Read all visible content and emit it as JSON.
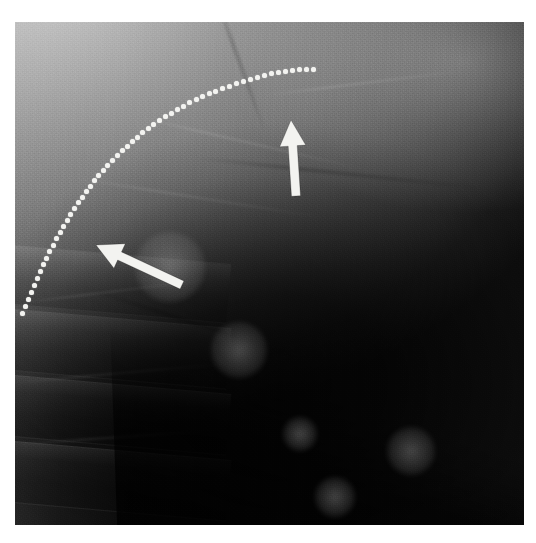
{
  "figure": {
    "kind": "radiograph",
    "modality": "X-ray",
    "view": "lateral chest / thoracolumbar spine",
    "alt": "Grayscale lateral radiograph of the chest showing a curved dotted line tracing a contour and two white arrows marking findings",
    "background_color": "#ffffff",
    "plate": {
      "x": 15,
      "y": 22,
      "width": 509,
      "height": 503,
      "tone_light": "#cfcfcf",
      "tone_mid": "#747474",
      "tone_dark": "#0d0d0d"
    }
  },
  "annotations": {
    "marker_color": "#f3f3f0",
    "dotted_curve": {
      "name": "contour-dotted-curve",
      "description": "dotted arc outlining an elevated contour",
      "dot_diameter": 5,
      "dot_count": 58,
      "points": [
        [
          22,
          313
        ],
        [
          25,
          306
        ],
        [
          28,
          299
        ],
        [
          31,
          292
        ],
        [
          34,
          285
        ],
        [
          37,
          278
        ],
        [
          40,
          271
        ],
        [
          43,
          264
        ],
        [
          46,
          258
        ],
        [
          49,
          251
        ],
        [
          53,
          245
        ],
        [
          56,
          238
        ],
        [
          60,
          232
        ],
        [
          63,
          226
        ],
        [
          67,
          220
        ],
        [
          70,
          214
        ],
        [
          74,
          208
        ],
        [
          78,
          202
        ],
        [
          82,
          197
        ],
        [
          86,
          191
        ],
        [
          90,
          186
        ],
        [
          94,
          180
        ],
        [
          98,
          175
        ],
        [
          103,
          170
        ],
        [
          107,
          165
        ],
        [
          112,
          160
        ],
        [
          117,
          155
        ],
        [
          122,
          150
        ],
        [
          127,
          146
        ],
        [
          132,
          141
        ],
        [
          137,
          137
        ],
        [
          142,
          132
        ],
        [
          148,
          128
        ],
        [
          153,
          124
        ],
        [
          159,
          120
        ],
        [
          165,
          116
        ],
        [
          171,
          113
        ],
        [
          177,
          109
        ],
        [
          183,
          106
        ],
        [
          189,
          102
        ],
        [
          196,
          99
        ],
        [
          202,
          96
        ],
        [
          209,
          93
        ],
        [
          215,
          91
        ],
        [
          222,
          88
        ],
        [
          229,
          86
        ],
        [
          236,
          83
        ],
        [
          243,
          81
        ],
        [
          250,
          79
        ],
        [
          257,
          77
        ],
        [
          264,
          75
        ],
        [
          271,
          73
        ],
        [
          278,
          72
        ],
        [
          285,
          71
        ],
        [
          292,
          70
        ],
        [
          299,
          69
        ],
        [
          306,
          69
        ],
        [
          313,
          69
        ]
      ]
    },
    "arrows": [
      {
        "name": "arrow-lower-left",
        "description": "white arrow pointing up and to the left toward the contour",
        "tip_x": 96,
        "tip_y": 245,
        "tail_x": 182,
        "tail_y": 285,
        "angle_deg": 205,
        "length": 95,
        "shaft_width": 9,
        "head_width": 27,
        "head_length": 26
      },
      {
        "name": "arrow-upper-vertical",
        "description": "white arrow pointing upward toward the opacity",
        "tip_x": 291,
        "tip_y": 120,
        "tail_x": 296,
        "tail_y": 196,
        "angle_deg": 274,
        "length": 76,
        "shaft_width": 9,
        "head_width": 26,
        "head_length": 26
      }
    ]
  },
  "anatomy_hints": {
    "vertebral_bodies": [
      {
        "top": 232,
        "height": 58
      },
      {
        "top": 296,
        "height": 60
      },
      {
        "top": 362,
        "height": 60
      },
      {
        "top": 428,
        "height": 60
      }
    ],
    "streaks": [
      {
        "left": 2,
        "top": 268,
        "width": 200,
        "rotate": -7
      },
      {
        "left": 0,
        "top": 350,
        "width": 215,
        "rotate": -5
      },
      {
        "left": 4,
        "top": 414,
        "width": 205,
        "rotate": -4
      },
      {
        "left": 120,
        "top": 120,
        "width": 230,
        "rotate": 13
      },
      {
        "left": 60,
        "top": 175,
        "width": 250,
        "rotate": 9
      },
      {
        "left": 250,
        "top": 60,
        "width": 200,
        "rotate": -7
      }
    ],
    "shadow_streaks": [
      {
        "left": 150,
        "top": 40,
        "width": 150,
        "rotate": 70
      },
      {
        "left": 178,
        "top": 150,
        "width": 300,
        "rotate": 6
      },
      {
        "left": 60,
        "top": 300,
        "width": 240,
        "rotate": 18
      }
    ],
    "blobs": [
      {
        "left": 268,
        "top": 395,
        "size": 34
      },
      {
        "left": 300,
        "top": 455,
        "size": 40
      },
      {
        "left": 372,
        "top": 405,
        "size": 48
      },
      {
        "left": 196,
        "top": 300,
        "size": 56
      },
      {
        "left": 120,
        "top": 210,
        "size": 70
      }
    ]
  }
}
